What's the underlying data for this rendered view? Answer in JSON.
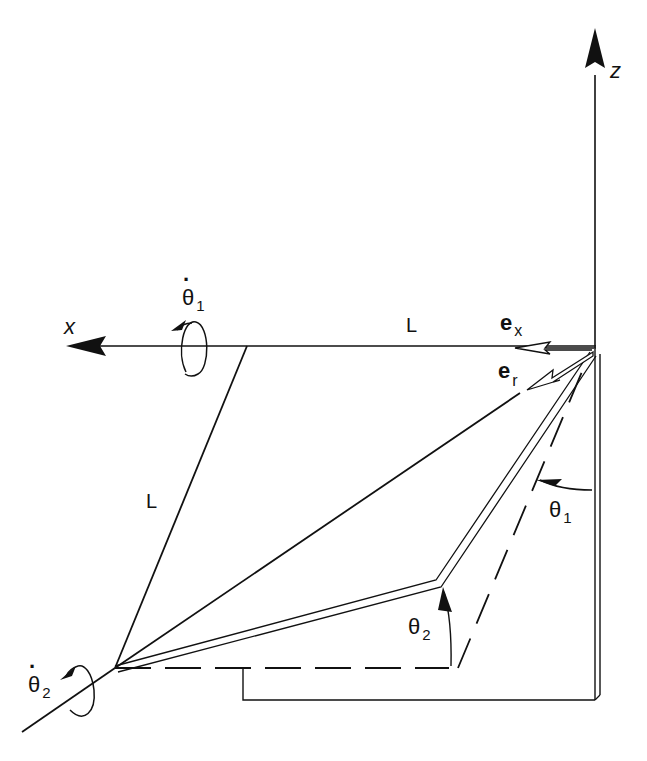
{
  "figure": {
    "type": "3D kinematic diagram of two-link arm",
    "background": "#ffffff",
    "stroke_color": "#111111"
  },
  "axes": {
    "z": {
      "label": "z"
    },
    "x": {
      "label": "x"
    }
  },
  "labels": {
    "link_length_top": "L",
    "link_length_side": "L",
    "unit_vector_x": {
      "base": "e",
      "sub": "x"
    },
    "unit_vector_r": {
      "base": "e",
      "sub": "r"
    },
    "angle_1": {
      "base": "θ",
      "sub": "1"
    },
    "angle_2": {
      "base": "θ",
      "sub": "2"
    },
    "rate_1": {
      "base": "θ",
      "dot": "·",
      "sub": "1"
    },
    "rate_2": {
      "base": "θ",
      "dot": "·",
      "sub": "2"
    }
  }
}
